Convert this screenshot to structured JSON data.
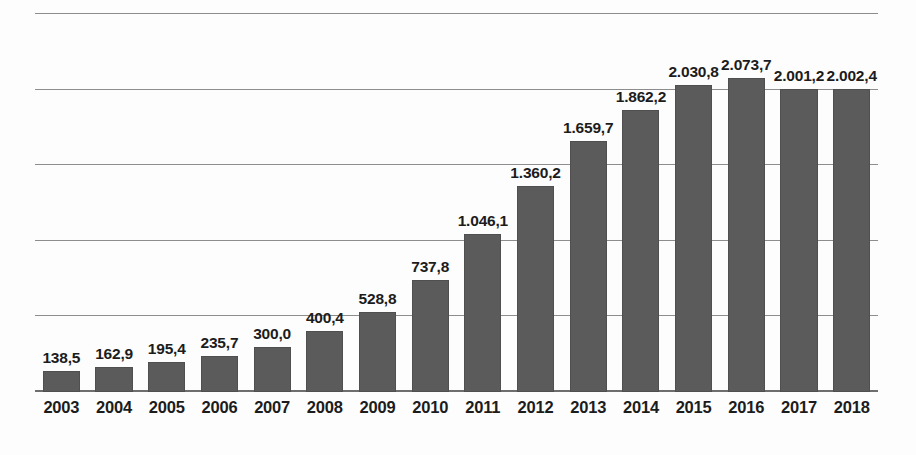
{
  "chart_data": {
    "type": "bar",
    "title": "",
    "subtitle": "",
    "xlabel": "",
    "ylabel": "",
    "categories": [
      "2003",
      "2004",
      "2005",
      "2006",
      "2007",
      "2008",
      "2009",
      "2010",
      "2011",
      "2012",
      "2013",
      "2014",
      "2015",
      "2016",
      "2017",
      "2018"
    ],
    "values": [
      138.5,
      162.9,
      195.4,
      235.7,
      300.0,
      400.4,
      528.8,
      737.8,
      1046.1,
      1360.2,
      1659.7,
      1862.2,
      2030.8,
      2073.7,
      2001.2,
      2002.4
    ],
    "value_labels": [
      "138,5",
      "162,9",
      "195,4",
      "235,7",
      "300,0",
      "400,4",
      "528,8",
      "737,8",
      "1.046,1",
      "1.360,2",
      "1.659,7",
      "1.862,2",
      "2.030,8",
      "2.073,7",
      "2.001,2",
      "2.002,4"
    ],
    "ylim": [
      0,
      2500
    ],
    "gridlines": [
      500,
      1000,
      1500,
      2000,
      2500
    ],
    "grid": true,
    "legend": "none",
    "series": [
      {
        "name": "",
        "values": [
          138.5,
          162.9,
          195.4,
          235.7,
          300.0,
          400.4,
          528.8,
          737.8,
          1046.1,
          1360.2,
          1659.7,
          1862.2,
          2030.8,
          2073.7,
          2001.2,
          2002.4
        ]
      }
    ],
    "colors": {
      "bar": "#5b5b5b",
      "gridline": "#8d8d8d",
      "axis": "#6e6e6e",
      "label_text": "#1c1c1c",
      "background": "#fdfdfd"
    }
  }
}
